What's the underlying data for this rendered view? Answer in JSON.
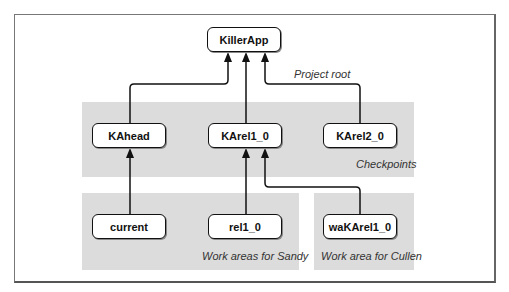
{
  "diagram": {
    "root": {
      "label": "KillerApp",
      "note": "Project root"
    },
    "regions": [
      {
        "id": "checkpoints",
        "label": "Checkpoints"
      },
      {
        "id": "sandy",
        "label": "Work areas for Sandy"
      },
      {
        "id": "cullen",
        "label": "Work area for Cullen"
      }
    ],
    "checkpoints": [
      {
        "label": "KAhead"
      },
      {
        "label": "KArel1_0"
      },
      {
        "label": "KArel2_0"
      }
    ],
    "work_areas": [
      {
        "label": "current",
        "parent": "KAhead"
      },
      {
        "label": "rel1_0",
        "parent": "KArel1_0"
      },
      {
        "label": "waKArel1_0",
        "parent": "KArel1_0"
      }
    ],
    "edges": [
      {
        "from": "KAhead",
        "to": "KillerApp"
      },
      {
        "from": "KArel1_0",
        "to": "KillerApp"
      },
      {
        "from": "KArel2_0",
        "to": "KillerApp"
      },
      {
        "from": "current",
        "to": "KAhead"
      },
      {
        "from": "rel1_0",
        "to": "KArel1_0"
      },
      {
        "from": "waKArel1_0",
        "to": "KArel1_0"
      }
    ]
  }
}
